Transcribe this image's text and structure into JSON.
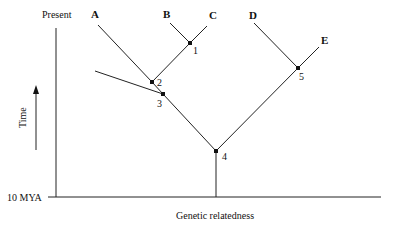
{
  "diagram": {
    "type": "phylogenetic-tree",
    "axis": {
      "top_label": "Present",
      "bottom_label": "10 MYA",
      "y_label": "Time",
      "x_label": "Genetic relatedness"
    },
    "taxa": [
      {
        "id": "A",
        "label": "A"
      },
      {
        "id": "B",
        "label": "B"
      },
      {
        "id": "C",
        "label": "C"
      },
      {
        "id": "D",
        "label": "D"
      },
      {
        "id": "E",
        "label": "E"
      }
    ],
    "nodes": [
      {
        "id": "1",
        "label": "1",
        "joins": [
          "B",
          "C"
        ]
      },
      {
        "id": "2",
        "label": "2",
        "joins": [
          "A",
          "node-1"
        ]
      },
      {
        "id": "3",
        "label": "3",
        "joins": [
          "node-2",
          "extinct-lineage"
        ]
      },
      {
        "id": "4",
        "label": "4",
        "joins": [
          "node-3",
          "node-5"
        ]
      },
      {
        "id": "5",
        "label": "5",
        "joins": [
          "D",
          "E"
        ]
      }
    ]
  }
}
